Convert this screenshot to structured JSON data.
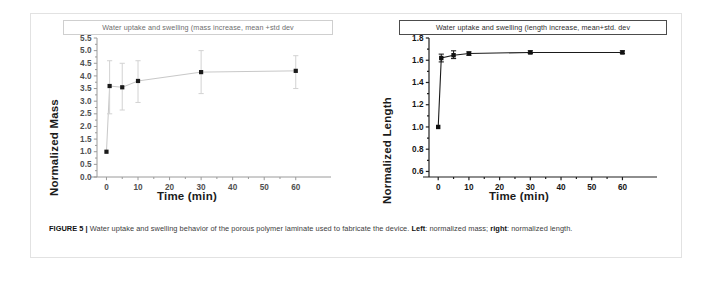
{
  "figure": {
    "caption_number": "FIGURE 5",
    "caption_separator": "|",
    "caption_text_1": "Water uptake and swelling behavior of the porous polymer laminate used to fabricate the device.",
    "caption_bold_left": "Left",
    "caption_text_2": ": normalized mass;",
    "caption_bold_right": "right",
    "caption_text_3": ": normalized length."
  },
  "chart_data": [
    {
      "type": "scatter",
      "panel": "left",
      "title": "Water uptake and swelling (mass increase, mean +std dev",
      "xlabel": "Time (min)",
      "ylabel": "Normalized Mass",
      "x": [
        0,
        1,
        5,
        10,
        30,
        60
      ],
      "values": [
        1.0,
        3.6,
        3.55,
        3.8,
        4.15,
        4.2
      ],
      "error_low": [
        1.0,
        2.5,
        2.65,
        2.95,
        3.3,
        3.5
      ],
      "error_high": [
        1.0,
        4.6,
        4.5,
        4.6,
        5.0,
        4.8
      ],
      "xticks": [
        0,
        10,
        20,
        30,
        40,
        50,
        60
      ],
      "xtick_labels": [
        "0",
        "10",
        "20",
        "30",
        "40",
        "50",
        "60"
      ],
      "yticks": [
        0.0,
        0.5,
        1.0,
        1.5,
        2.0,
        2.5,
        3.0,
        3.5,
        4.0,
        4.5,
        5.0,
        5.5
      ],
      "ytick_labels": [
        "0.0",
        "0.5",
        "1.0",
        "1.5",
        "2.0",
        "2.5",
        "3.0",
        "3.5",
        "4.0",
        "4.5",
        "5.0",
        "5.5"
      ],
      "xlim": [
        -3,
        68
      ],
      "ylim": [
        0.0,
        5.5
      ],
      "grid": false,
      "legend": "none",
      "marker_color": "#1a1a1a",
      "line_color": "#c8c8c8",
      "error_color": "#d2d2d2"
    },
    {
      "type": "scatter",
      "panel": "right",
      "title": "Water uptake and swelling (length increase, mean+std. dev",
      "xlabel": "Time (min)",
      "ylabel": "Normalized Length",
      "x": [
        0,
        1,
        5,
        10,
        30,
        60
      ],
      "values": [
        1.0,
        1.62,
        1.645,
        1.66,
        1.67,
        1.67
      ],
      "error_low": [
        1.0,
        1.585,
        1.615,
        1.645,
        1.66,
        1.66
      ],
      "error_high": [
        1.0,
        1.655,
        1.685,
        1.675,
        1.685,
        1.685
      ],
      "xticks": [
        0,
        10,
        20,
        30,
        40,
        50,
        60
      ],
      "xtick_labels": [
        "0",
        "10",
        "20",
        "30",
        "40",
        "50",
        "60"
      ],
      "yticks": [
        0.6,
        0.8,
        1.0,
        1.2,
        1.4,
        1.6,
        1.8
      ],
      "ytick_labels": [
        "0.6",
        "0.8",
        "1.0",
        "1.2",
        "1.4",
        "1.6",
        "1.8"
      ],
      "xlim": [
        -3,
        68
      ],
      "ylim": [
        0.55,
        1.8
      ],
      "grid": false,
      "legend": "none",
      "marker_color": "#111111",
      "line_color": "#1a1a1a",
      "error_color": "#222222"
    }
  ]
}
